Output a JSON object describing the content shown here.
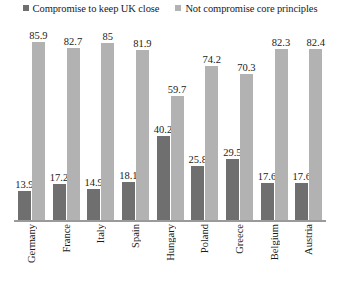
{
  "chart_data": {
    "type": "bar",
    "title": "",
    "xlabel": "",
    "ylabel": "",
    "ylim": [
      0,
      90
    ],
    "grid": false,
    "legend_position": "top",
    "categories": [
      "Germany",
      "France",
      "Italy",
      "Spain",
      "Hungary",
      "Poland",
      "Greece",
      "Belgium",
      "Austria"
    ],
    "series": [
      {
        "name": "Compromise to keep UK close",
        "color": "#6f6f6f",
        "values": [
          13.9,
          17.2,
          14.9,
          18.1,
          40.2,
          25.8,
          29.5,
          17.6,
          17.6
        ],
        "labels": [
          "13.9",
          "17.2",
          "14.9",
          "18.1",
          "40.2",
          "25.8",
          "29.5",
          "17.6",
          "17.6"
        ]
      },
      {
        "name": "Not compromise core principles",
        "color": "#b2b2b2",
        "values": [
          85.9,
          82.7,
          85,
          81.9,
          59.7,
          74.2,
          70.3,
          82.3,
          82.4
        ],
        "labels": [
          "85.9",
          "82.7",
          "85",
          "81.9",
          "59.7",
          "74.2",
          "70.3",
          "82.3",
          "82.4"
        ]
      }
    ]
  },
  "legend": {
    "items": [
      {
        "label": "Compromise to keep UK close",
        "color": "#6f6f6f"
      },
      {
        "label": "Not compromise core principles",
        "color": "#b2b2b2"
      }
    ]
  }
}
